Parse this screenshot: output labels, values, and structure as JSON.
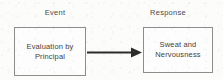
{
  "diagram": {
    "title_labels": {
      "event": "Event",
      "response": "Response"
    },
    "nodes": [
      {
        "id": "event-node",
        "text": "Evaluation by\nPrincipal"
      },
      {
        "id": "response-node",
        "text": "Sweat and\nNervousness"
      }
    ],
    "connector": {
      "type": "arrow",
      "direction": "left-to-right",
      "from": "event-node",
      "to": "response-node"
    },
    "colors": {
      "border": "#8d8d8d",
      "text": "#3f3f3f",
      "label": "#4a4a4a",
      "arrow": "#2b2b2b",
      "background": "#fcfcfb"
    }
  }
}
